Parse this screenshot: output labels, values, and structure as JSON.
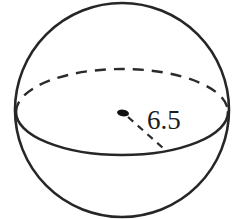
{
  "figure": {
    "name": "sphere-with-radius",
    "type": "geometry-diagram",
    "shape": "sphere",
    "background_color": "#ffffff",
    "stroke_color": "#262626",
    "label_color": "#1c1c1c",
    "measurement": {
      "label": "6.5",
      "quantity": "radius",
      "from": "center-point",
      "to": "equator-edge"
    },
    "elements": {
      "outline_name": "sphere-outline",
      "equator_back_name": "equator-back-arc-dashed",
      "equator_front_name": "equator-front-arc-solid",
      "center_dot_name": "center-point-dot",
      "radius_line_name": "radius-dashed-line"
    },
    "geometry": {
      "circle_cx": 122,
      "circle_cy": 110,
      "circle_r": 107,
      "ellipse_cx": 122,
      "ellipse_cy": 112,
      "ellipse_rx": 106,
      "ellipse_ry": 43,
      "center_dot_x": 123,
      "center_dot_y": 113,
      "radius_end_x": 163,
      "radius_end_y": 148
    }
  }
}
